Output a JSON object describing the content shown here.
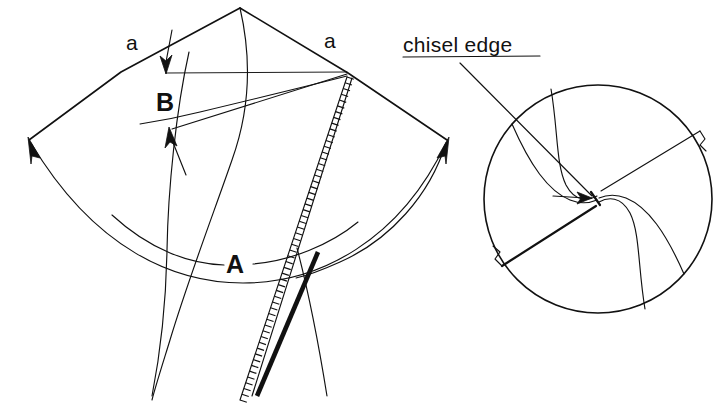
{
  "figure": {
    "background_color": "#ffffff",
    "ink_color": "#111111",
    "width": 722,
    "height": 406
  },
  "labels": {
    "angle_left": "a",
    "angle_right": "a",
    "region_b": "B",
    "region_a": "A",
    "callout": "chisel edge"
  },
  "left_diagram": {
    "name": "developed-cone-view",
    "apex": {
      "x": 240,
      "y": 8
    },
    "left_vertex": {
      "x": 29,
      "y": 140
    },
    "right_vertex": {
      "x": 447,
      "y": 140
    },
    "shoulder_left": {
      "x": 120,
      "y": 72
    },
    "shoulder_right": {
      "x": 348,
      "y": 73
    },
    "arrow_down_label": "a",
    "arrow_up_label": "a"
  },
  "right_diagram": {
    "name": "drill-point-end-view",
    "circle": {
      "cx": 598,
      "cy": 199,
      "r": 114
    },
    "flute_count": 2,
    "has_chisel_edge": true
  },
  "chart_data": {
    "type": "diagram",
    "annotations": [
      "a",
      "a",
      "B",
      "A",
      "chisel edge"
    ]
  }
}
